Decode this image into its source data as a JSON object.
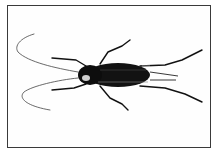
{
  "image": {
    "subject": "cricket illustration",
    "description": "Black ink drawing of a cricket viewed from above, with long curved antennae extending to the left and legs spread, inside a thin rectangular frame",
    "colors": {
      "background": "#ffffff",
      "ink": "#111111",
      "frame": "#3a3a3a"
    }
  }
}
